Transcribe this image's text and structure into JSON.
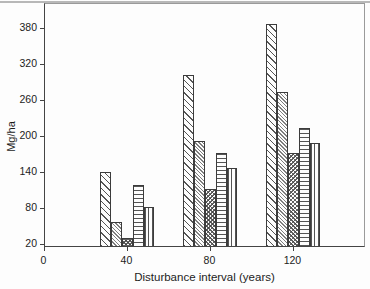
{
  "chart_data": {
    "type": "bar",
    "title": "d: total floor mass at the end (year 240) of simulations",
    "xlabel": "Disturbance interval (years)",
    "ylabel": "Mg/ha",
    "categories": [
      40,
      80,
      120
    ],
    "x_ticks": [
      "0",
      "40",
      "80",
      "120"
    ],
    "y_ticks": [
      "20",
      "80",
      "140",
      "200",
      "260",
      "320",
      "380"
    ],
    "xlim": [
      0,
      155
    ],
    "ylim": [
      15,
      421
    ],
    "grid": false,
    "legend_position": "none",
    "series": [
      {
        "name": "diagonal-hatch-coarse",
        "pattern": "diag",
        "values": [
          138,
          300,
          385
        ]
      },
      {
        "name": "diagonal-hatch-fine",
        "pattern": "diagfine",
        "values": [
          55,
          190,
          272
        ]
      },
      {
        "name": "crosshatch",
        "pattern": "cross",
        "values": [
          28,
          110,
          170
        ]
      },
      {
        "name": "horizontal-hatch",
        "pattern": "horiz",
        "values": [
          117,
          170,
          212
        ]
      },
      {
        "name": "vertical-hatch",
        "pattern": "vert",
        "values": [
          80,
          145,
          186
        ]
      }
    ]
  },
  "colors": {
    "background": "#fdfdfd",
    "axis": "#444444",
    "box_border": "#9a9a9a",
    "hatch": "#3c3c3c",
    "text": "#1c1c1c"
  }
}
